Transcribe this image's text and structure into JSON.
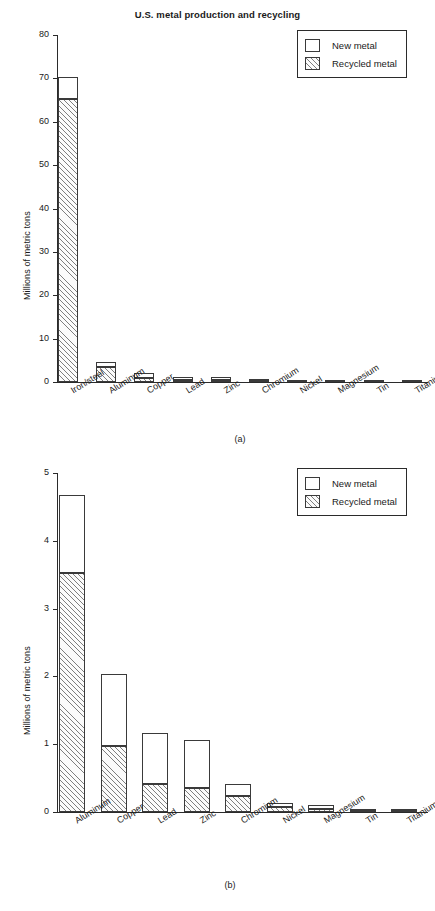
{
  "figure": {
    "title": "U.S. metal production and recycling",
    "legend": {
      "new_label": "New metal",
      "recycled_label": "Recycled metal"
    },
    "subcaption_a": "(a)",
    "subcaption_b": "(b)"
  },
  "chart_data": [
    {
      "id": "a",
      "type": "bar",
      "stacked": true,
      "title": "U.S. metal production and recycling",
      "subcaption": "(a)",
      "xlabel": "",
      "ylabel": "Millions of metric tons",
      "ylim": [
        0,
        80
      ],
      "yticks": [
        0,
        10,
        20,
        30,
        40,
        50,
        60,
        70,
        80
      ],
      "ytick_labels": [
        "0",
        "10",
        "20",
        "30",
        "40",
        "50",
        "60",
        "70",
        "80"
      ],
      "grid": false,
      "legend_position": "top-right",
      "categories": [
        "Iron/steel",
        "Aluminum",
        "Copper",
        "Lead",
        "Zinc",
        "Chromium",
        "Nickel",
        "Magnesium",
        "Tin",
        "Titanium"
      ],
      "series": [
        {
          "name": "Recycled metal",
          "values": [
            65.3,
            3.52,
            0.97,
            0.42,
            0.35,
            0.24,
            0.08,
            0.05,
            0.02,
            0.01
          ]
        },
        {
          "name": "New metal",
          "values": [
            5.0,
            1.15,
            1.06,
            0.74,
            0.71,
            0.17,
            0.06,
            0.05,
            0.02,
            0.02
          ]
        }
      ],
      "totals": [
        70.3,
        4.67,
        2.03,
        1.16,
        1.06,
        0.41,
        0.14,
        0.1,
        0.04,
        0.03
      ]
    },
    {
      "id": "b",
      "type": "bar",
      "stacked": true,
      "title": "",
      "subcaption": "(b)",
      "xlabel": "",
      "ylabel": "Millions of metric tons",
      "ylim": [
        0,
        5
      ],
      "yticks": [
        0,
        1,
        2,
        3,
        4,
        5
      ],
      "ytick_labels": [
        "0",
        "1",
        "2",
        "3",
        "4",
        "5"
      ],
      "grid": false,
      "legend_position": "top-right",
      "categories": [
        "Aluminum",
        "Copper",
        "Lead",
        "Zinc",
        "Chromium",
        "Nickel",
        "Magnesium",
        "Tin",
        "Titanium"
      ],
      "series": [
        {
          "name": "Recycled metal",
          "values": [
            3.52,
            0.97,
            0.42,
            0.35,
            0.24,
            0.08,
            0.05,
            0.02,
            0.01
          ]
        },
        {
          "name": "New metal",
          "values": [
            1.15,
            1.06,
            0.74,
            0.71,
            0.17,
            0.06,
            0.05,
            0.02,
            0.02
          ]
        }
      ],
      "totals": [
        4.67,
        2.03,
        1.16,
        1.06,
        0.41,
        0.14,
        0.1,
        0.04,
        0.03
      ]
    }
  ]
}
